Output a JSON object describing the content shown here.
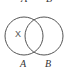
{
  "diagram": {
    "type": "venn",
    "sets": [
      {
        "label": "A",
        "cx": 24,
        "cy": 36,
        "r": 19
      },
      {
        "label": "B",
        "cx": 44,
        "cy": 36,
        "r": 19
      }
    ],
    "region_marker": "X",
    "top_labels": [
      "A",
      "B"
    ],
    "stroke_color": "#555555"
  }
}
